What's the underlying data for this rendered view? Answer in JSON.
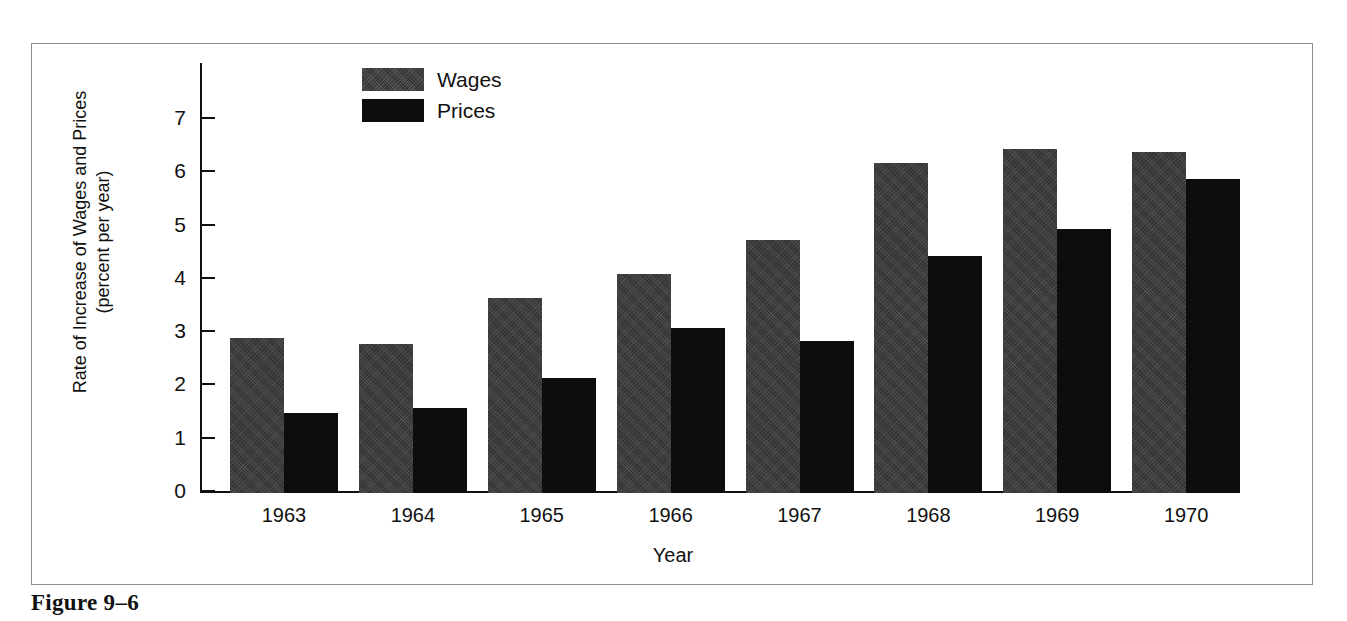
{
  "caption": "Figure 9–6",
  "legend": {
    "position": "top-center",
    "items": [
      {
        "label": "Wages",
        "color": "#3b3b3b",
        "swatch": "wages"
      },
      {
        "label": "Prices",
        "color": "#0d0d0d",
        "swatch": "prices"
      }
    ]
  },
  "axes": {
    "y_title_line1": "Rate of Increase of Wages and Prices",
    "y_title_line2": "(percent per year)",
    "x_title": "Year",
    "y_ticks": [
      "7",
      "6",
      "5",
      "4",
      "3",
      "2",
      "1",
      "0"
    ]
  },
  "chart_data": {
    "type": "bar",
    "title": "",
    "xlabel": "Year",
    "ylabel": "Rate of Increase of Wages and Prices (percent per year)",
    "categories": [
      "1963",
      "1964",
      "1965",
      "1966",
      "1967",
      "1968",
      "1969",
      "1970"
    ],
    "series": [
      {
        "name": "Wages",
        "color": "#3b3b3b",
        "values": [
          2.9,
          2.8,
          3.65,
          4.1,
          4.75,
          6.2,
          6.45,
          6.4
        ]
      },
      {
        "name": "Prices",
        "color": "#0d0d0d",
        "values": [
          1.5,
          1.6,
          2.15,
          3.1,
          2.85,
          4.45,
          4.95,
          5.9
        ]
      }
    ],
    "ylim": [
      0,
      7.6
    ],
    "yticks": [
      0,
      1,
      2,
      3,
      4,
      5,
      6,
      7
    ],
    "grid": false,
    "legend_position": "top-center"
  }
}
